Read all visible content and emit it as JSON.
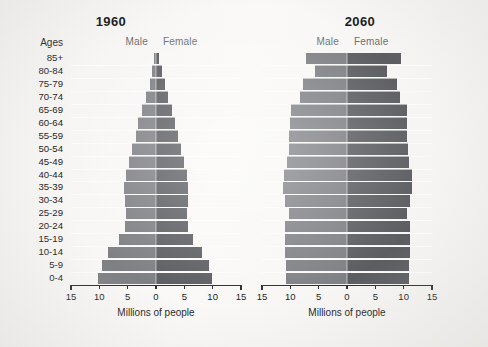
{
  "figure": {
    "axis_title": "Millions of people",
    "ages_header": "Ages",
    "male_label": "Male",
    "female_label": "Female",
    "tick_labels": [
      "15",
      "10",
      "5",
      "0",
      "5",
      "10",
      "15"
    ],
    "tick_values": [
      -15,
      -10,
      -5,
      0,
      5,
      10,
      15
    ],
    "colors": {
      "male_bar": "#7e8084",
      "female_bar": "#5b5d61",
      "axis": "#2a2c2e",
      "text": "#1c1c1c",
      "legend_text": "#6c7075",
      "page_background": "#f7f6f4"
    }
  },
  "chart_data": [
    {
      "type": "bar",
      "subtype": "population-pyramid",
      "title": "1960",
      "xlabel": "Millions of people",
      "ylabel": "Ages",
      "xlim": [
        -15,
        15
      ],
      "xticks": [
        -15,
        -10,
        -5,
        0,
        5,
        10,
        15
      ],
      "xticklabels": [
        "15",
        "10",
        "5",
        "0",
        "5",
        "10",
        "15"
      ],
      "grid": false,
      "legend_position": "above-axes",
      "categories": [
        "85+",
        "80-84",
        "75-79",
        "70-74",
        "65-69",
        "60-64",
        "55-59",
        "50-54",
        "45-49",
        "40-44",
        "35-39",
        "30-34",
        "25-29",
        "20-24",
        "15-19",
        "10-14",
        "5-9",
        "0-4"
      ],
      "series": [
        {
          "name": "Male",
          "side": "left",
          "values": [
            0.4,
            0.7,
            1.1,
            1.7,
            2.4,
            3.1,
            3.6,
            4.2,
            4.7,
            5.3,
            5.6,
            5.5,
            5.3,
            5.4,
            6.6,
            8.4,
            9.6,
            10.3
          ]
        },
        {
          "name": "Female",
          "side": "right",
          "values": [
            0.6,
            1.0,
            1.5,
            2.1,
            2.8,
            3.4,
            3.9,
            4.4,
            4.9,
            5.4,
            5.7,
            5.7,
            5.5,
            5.6,
            6.6,
            8.2,
            9.3,
            9.9
          ]
        }
      ]
    },
    {
      "type": "bar",
      "subtype": "population-pyramid",
      "title": "2060",
      "xlabel": "Millions of people",
      "ylabel": "Ages",
      "xlim": [
        -15,
        15
      ],
      "xticks": [
        -15,
        -10,
        -5,
        0,
        5,
        10,
        15
      ],
      "xticklabels": [
        "15",
        "10",
        "5",
        "0",
        "5",
        "10",
        "15"
      ],
      "grid": false,
      "legend_position": "above-axes",
      "categories": [
        "85+",
        "80-84",
        "75-79",
        "70-74",
        "65-69",
        "60-64",
        "55-59",
        "50-54",
        "45-49",
        "40-44",
        "35-39",
        "30-34",
        "25-29",
        "20-24",
        "15-19",
        "10-14",
        "5-9",
        "0-4"
      ],
      "series": [
        {
          "name": "Male",
          "side": "left",
          "values": [
            7.3,
            5.7,
            7.7,
            8.3,
            9.9,
            10.1,
            10.2,
            10.3,
            10.6,
            11.2,
            11.3,
            11.0,
            10.3,
            10.9,
            11.0,
            10.9,
            10.8,
            10.7
          ]
        },
        {
          "name": "Female",
          "side": "right",
          "values": [
            9.6,
            7.1,
            8.8,
            9.3,
            10.6,
            10.6,
            10.6,
            10.7,
            10.9,
            11.4,
            11.5,
            11.2,
            10.5,
            11.1,
            11.2,
            11.1,
            11.0,
            10.9
          ]
        }
      ]
    }
  ]
}
